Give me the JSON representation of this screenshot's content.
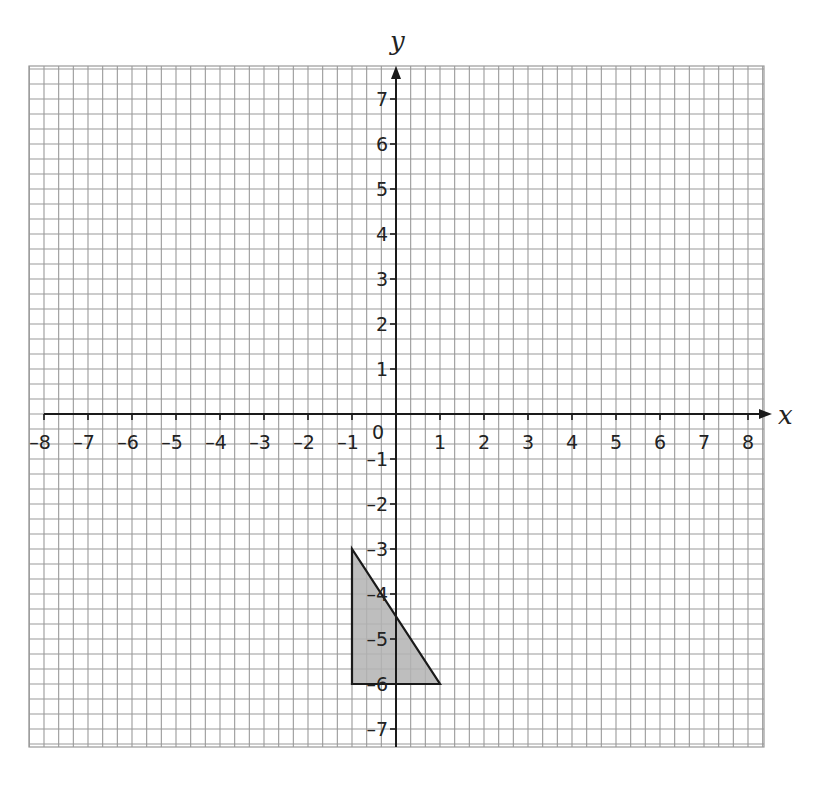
{
  "chart_data": {
    "type": "scatter",
    "title": "",
    "xlabel": "x",
    "ylabel": "y",
    "xlim": [
      -8,
      8
    ],
    "ylim": [
      -7,
      7
    ],
    "grid": true,
    "grid_minor_per_unit": 3,
    "x_ticks": [
      "-8",
      "-7",
      "-6",
      "-5",
      "-4",
      "-3",
      "-2",
      "-1",
      "1",
      "2",
      "3",
      "4",
      "5",
      "6",
      "7",
      "8"
    ],
    "y_ticks": [
      "7",
      "6",
      "5",
      "4",
      "3",
      "2",
      "1",
      "-1",
      "-2",
      "-3",
      "-4",
      "-5",
      "-6",
      "-7"
    ],
    "origin_label": "0",
    "shapes": [
      {
        "name": "triangle",
        "type": "polygon",
        "vertices": [
          [
            -1,
            -3
          ],
          [
            -1,
            -6
          ],
          [
            1,
            -6
          ]
        ],
        "fill": "#b3b3b3",
        "stroke": "#1a1a1a"
      }
    ]
  },
  "colors": {
    "grid": "#9a9a9a",
    "axis": "#1a1a1a",
    "shape_fill": "#b3b3b3"
  }
}
